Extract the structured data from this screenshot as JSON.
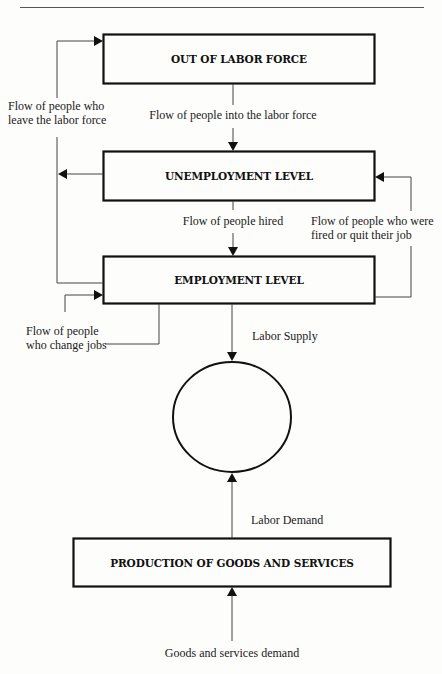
{
  "diagram": {
    "type": "labor market flow diagram",
    "boxes": {
      "out_of_labor_force": "OUT OF LABOR FORCE",
      "unemployment_level": "UNEMPLOYMENT LEVEL",
      "employment_level": "EMPLOYMENT LEVEL",
      "production": "PRODUCTION OF GOODS AND SERVICES"
    },
    "labels": {
      "into_labor_force": "Flow of people into the labor force",
      "leave_labor_force_line1": "Flow of people who",
      "leave_labor_force_line2": "leave the labor force",
      "hired": "Flow of people hired",
      "fired_line1": "Flow of people who were",
      "fired_line2": "fired or quit their job",
      "change_jobs_line1": "Flow of people",
      "change_jobs_line2": "who change jobs",
      "labor_supply": "Labor Supply",
      "labor_demand": "Labor Demand",
      "goods_demand": "Goods and services demand"
    },
    "nodes": [
      {
        "id": "out_of_labor_force",
        "shape": "rectangle"
      },
      {
        "id": "unemployment_level",
        "shape": "rectangle"
      },
      {
        "id": "employment_level",
        "shape": "rectangle"
      },
      {
        "id": "market",
        "shape": "circle",
        "label": ""
      },
      {
        "id": "production",
        "shape": "rectangle"
      }
    ],
    "edges": [
      {
        "from": "out_of_labor_force",
        "to": "unemployment_level",
        "label": "Flow of people into the labor force"
      },
      {
        "from": "unemployment_level",
        "to": "out_of_labor_force",
        "label": "Flow of people who leave the labor force"
      },
      {
        "from": "employment_level",
        "to": "out_of_labor_force",
        "label": "Flow of people who leave the labor force"
      },
      {
        "from": "unemployment_level",
        "to": "employment_level",
        "label": "Flow of people hired"
      },
      {
        "from": "employment_level",
        "to": "unemployment_level",
        "label": "Flow of people who were fired or quit their job"
      },
      {
        "from": "employment_level",
        "to": "employment_level",
        "label": "Flow of people who change jobs"
      },
      {
        "from": "employment_level",
        "to": "market",
        "label": "Labor Supply"
      },
      {
        "from": "production",
        "to": "market",
        "label": "Labor Demand"
      },
      {
        "from": "external",
        "to": "production",
        "label": "Goods and services demand"
      }
    ]
  }
}
